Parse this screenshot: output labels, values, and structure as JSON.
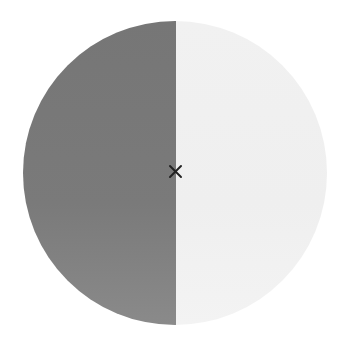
{
  "figure": {
    "shape": "circle-split-vertical",
    "left_half_color": "#7a7a7a",
    "right_half_color": "#efefef",
    "center_marker": "cross-icon",
    "center_marker_color": "#222222"
  }
}
